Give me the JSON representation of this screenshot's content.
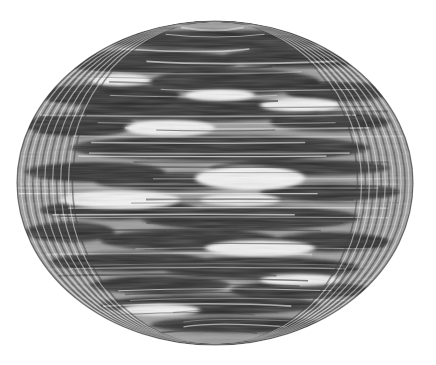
{
  "image": {
    "width": 436,
    "height": 365,
    "background": "#ffffff",
    "subject": "striped ellipsoidal sphere projection (grayscale)",
    "ellipse": {
      "cx": 215,
      "cy": 183,
      "rx": 198,
      "ry": 162
    },
    "colors": {
      "dark": "#2b2b2b",
      "mid": "#8a8a8a",
      "light": "#f4f4f4"
    },
    "dark_bands": [
      {
        "cx": 215,
        "cy": 40,
        "rx": 120,
        "ry": 10
      },
      {
        "cx": 150,
        "cy": 62,
        "rx": 90,
        "ry": 12
      },
      {
        "cx": 300,
        "cy": 58,
        "rx": 80,
        "ry": 10
      },
      {
        "cx": 235,
        "cy": 82,
        "rx": 85,
        "ry": 13
      },
      {
        "cx": 110,
        "cy": 95,
        "rx": 70,
        "ry": 12
      },
      {
        "cx": 340,
        "cy": 92,
        "rx": 55,
        "ry": 10
      },
      {
        "cx": 200,
        "cy": 110,
        "rx": 120,
        "ry": 12
      },
      {
        "cx": 80,
        "cy": 125,
        "rx": 55,
        "ry": 12
      },
      {
        "cx": 330,
        "cy": 122,
        "rx": 60,
        "ry": 10
      },
      {
        "cx": 220,
        "cy": 148,
        "rx": 150,
        "ry": 13
      },
      {
        "cx": 95,
        "cy": 172,
        "rx": 70,
        "ry": 10
      },
      {
        "cx": 300,
        "cy": 168,
        "rx": 90,
        "ry": 8
      },
      {
        "cx": 175,
        "cy": 182,
        "rx": 80,
        "ry": 9
      },
      {
        "cx": 330,
        "cy": 192,
        "rx": 70,
        "ry": 9
      },
      {
        "cx": 120,
        "cy": 210,
        "rx": 80,
        "ry": 10
      },
      {
        "cx": 250,
        "cy": 218,
        "rx": 110,
        "ry": 12
      },
      {
        "cx": 70,
        "cy": 232,
        "rx": 45,
        "ry": 10
      },
      {
        "cx": 190,
        "cy": 240,
        "rx": 90,
        "ry": 11
      },
      {
        "cx": 330,
        "cy": 242,
        "rx": 60,
        "ry": 10
      },
      {
        "cx": 130,
        "cy": 262,
        "rx": 80,
        "ry": 10
      },
      {
        "cx": 260,
        "cy": 268,
        "rx": 100,
        "ry": 11
      },
      {
        "cx": 160,
        "cy": 285,
        "rx": 70,
        "ry": 9
      },
      {
        "cx": 300,
        "cy": 290,
        "rx": 70,
        "ry": 9
      },
      {
        "cx": 210,
        "cy": 305,
        "rx": 110,
        "ry": 10
      },
      {
        "cx": 240,
        "cy": 325,
        "rx": 90,
        "ry": 8
      }
    ],
    "light_patches": [
      {
        "cx": 250,
        "cy": 178,
        "rx": 55,
        "ry": 12
      },
      {
        "cx": 120,
        "cy": 200,
        "rx": 60,
        "ry": 9
      },
      {
        "cx": 240,
        "cy": 200,
        "rx": 40,
        "ry": 6
      },
      {
        "cx": 170,
        "cy": 128,
        "rx": 45,
        "ry": 8
      },
      {
        "cx": 300,
        "cy": 105,
        "rx": 40,
        "ry": 7
      },
      {
        "cx": 260,
        "cy": 248,
        "rx": 55,
        "ry": 8
      },
      {
        "cx": 120,
        "cy": 80,
        "rx": 30,
        "ry": 6
      },
      {
        "cx": 300,
        "cy": 280,
        "rx": 40,
        "ry": 6
      },
      {
        "cx": 220,
        "cy": 95,
        "rx": 35,
        "ry": 6
      },
      {
        "cx": 160,
        "cy": 310,
        "rx": 40,
        "ry": 6
      }
    ],
    "meridian_count": 14,
    "streak_count": 60
  }
}
